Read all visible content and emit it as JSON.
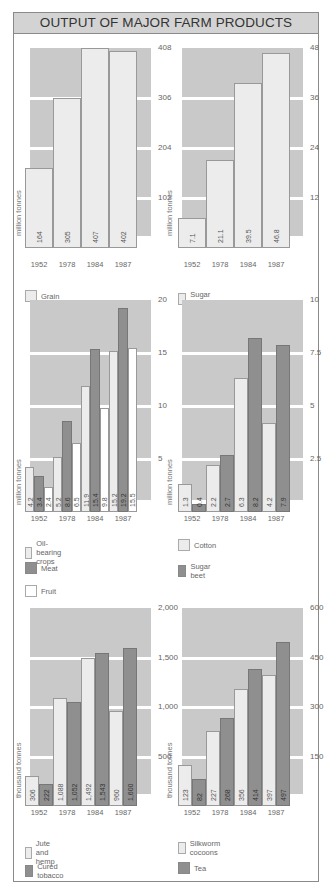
{
  "title": "OUTPUT OF MAJOR FARM PRODUCTS",
  "colors": {
    "plot_bg": "#c9c9c9",
    "light_bar": "#ececec",
    "dark_bar": "#8f8f8f",
    "white_bar": "#ffffff",
    "gridline": "#ffffff",
    "title_bg": "#d3d3d3"
  },
  "chart_data": [
    {
      "type": "bar",
      "title": "Grain",
      "ylabel": "million tonnes",
      "categories": [
        "1952",
        "1978",
        "1984",
        "1987"
      ],
      "series": [
        {
          "name": "Grain",
          "style": "light",
          "values": [
            164,
            305,
            407,
            402
          ]
        }
      ],
      "value_labels": [
        [
          "164",
          "305",
          "407",
          "402"
        ]
      ],
      "yticks": [
        "102",
        "204",
        "306",
        "408"
      ],
      "ylim": [
        0,
        408
      ],
      "grid": true,
      "legend": [
        "Grain"
      ]
    },
    {
      "type": "bar",
      "title": "Sugar cane",
      "ylabel": "million tonnes",
      "categories": [
        "1952",
        "1978",
        "1984",
        "1987"
      ],
      "series": [
        {
          "name": "Sugar cane",
          "style": "light",
          "values": [
            7.1,
            21.1,
            39.5,
            46.8
          ]
        }
      ],
      "value_labels": [
        [
          "7.1",
          "21.1",
          "39.5",
          "46.8"
        ]
      ],
      "yticks": [
        "12",
        "24",
        "36",
        "48"
      ],
      "ylim": [
        0,
        48
      ],
      "grid": true,
      "legend": [
        "Sugar cane"
      ]
    },
    {
      "type": "bar",
      "title": "Oil-bearing crops, Meat, Fruit",
      "ylabel": "million tonnes",
      "categories": [
        "1952",
        "1978",
        "1984",
        "1987"
      ],
      "series": [
        {
          "name": "Oil-bearing crops",
          "style": "light",
          "values": [
            4.2,
            5.2,
            11.9,
            15.2
          ]
        },
        {
          "name": "Meat",
          "style": "dark",
          "values": [
            3.4,
            8.6,
            15.4,
            19.2
          ]
        },
        {
          "name": "Fruit",
          "style": "white",
          "values": [
            2.4,
            6.5,
            9.8,
            15.5
          ]
        }
      ],
      "value_labels": [
        [
          "4.2",
          "5.2",
          "11.9",
          "15.2"
        ],
        [
          "3.4",
          "8.6",
          "15.4",
          "19.2"
        ],
        [
          "2.4",
          "6.5",
          "9.8",
          "15.5"
        ]
      ],
      "yticks": [
        "5",
        "10",
        "15",
        "20"
      ],
      "ylim": [
        0,
        20
      ],
      "grid": true,
      "legend": [
        "Oil-bearing crops",
        "Meat",
        "Fruit"
      ]
    },
    {
      "type": "bar",
      "title": "Cotton, Sugar beet",
      "ylabel": "million tonnes",
      "categories": [
        "1952",
        "1978",
        "1984",
        "1987"
      ],
      "series": [
        {
          "name": "Cotton",
          "style": "light",
          "values": [
            1.3,
            2.2,
            6.3,
            4.2
          ]
        },
        {
          "name": "Sugar beet",
          "style": "dark",
          "values": [
            0.4,
            2.7,
            8.2,
            7.9
          ]
        }
      ],
      "value_labels": [
        [
          "1.3",
          "2.2",
          "6.3",
          "4.2"
        ],
        [
          "0.4",
          "2.7",
          "8.2",
          "7.9"
        ]
      ],
      "yticks": [
        "2.5",
        "5",
        "7.5",
        "10"
      ],
      "ylim": [
        0,
        10
      ],
      "grid": true,
      "legend": [
        "Cotton",
        "Sugar beet"
      ]
    },
    {
      "type": "bar",
      "title": "Jute and hemp, Cured tobacco",
      "ylabel": "thousand tonnes",
      "categories": [
        "1952",
        "1978",
        "1984",
        "1987"
      ],
      "series": [
        {
          "name": "Jute and hemp",
          "style": "light",
          "values": [
            306,
            1088,
            1492,
            960
          ]
        },
        {
          "name": "Cured tobacco",
          "style": "dark",
          "values": [
            222,
            1052,
            1543,
            1600
          ]
        }
      ],
      "value_labels": [
        [
          "306",
          "1,088",
          "1,492",
          "960"
        ],
        [
          "222",
          "1,052",
          "1,543",
          "1,600"
        ]
      ],
      "yticks": [
        "500",
        "1,000",
        "1,500",
        "2,000"
      ],
      "ylim": [
        0,
        2000
      ],
      "grid": true,
      "legend": [
        "Jute and hemp",
        "Cured tobacco"
      ]
    },
    {
      "type": "bar",
      "title": "Silkworm cocoons, Tea",
      "ylabel": "thousand tonnes",
      "categories": [
        "1952",
        "1978",
        "1984",
        "1987"
      ],
      "series": [
        {
          "name": "Silkworm cocoons",
          "style": "light",
          "values": [
            123,
            227,
            356,
            397
          ]
        },
        {
          "name": "Tea",
          "style": "dark",
          "values": [
            82,
            268,
            414,
            497
          ]
        }
      ],
      "value_labels": [
        [
          "123",
          "227",
          "356",
          "397"
        ],
        [
          "82",
          "268",
          "414",
          "497"
        ]
      ],
      "yticks": [
        "150",
        "300",
        "450",
        "600"
      ],
      "ylim": [
        0,
        600
      ],
      "grid": true,
      "legend": [
        "Silkworm cocoons",
        "Tea"
      ]
    }
  ]
}
